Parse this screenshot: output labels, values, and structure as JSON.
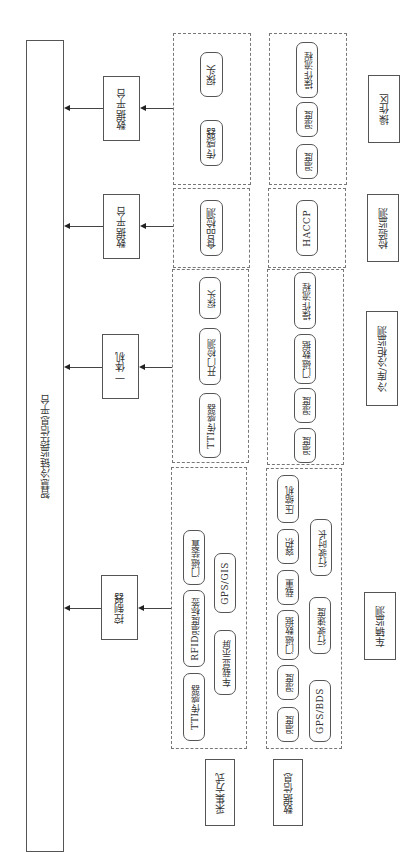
{
  "platform": {
    "label": "智慧冷链监控信息平台"
  },
  "devices": [
    {
      "id": "op",
      "label": "数据平台"
    },
    {
      "id": "insp",
      "label": "数据平台"
    },
    {
      "id": "cold",
      "label": "一体机"
    },
    {
      "id": "veh",
      "label": "控制器"
    }
  ],
  "collection": {
    "op": [
      "传感器",
      "探头"
    ],
    "insp": [
      "食品检测"
    ],
    "cold": [
      "TTI传感器",
      "开门检测",
      "探头"
    ],
    "veh": [
      "TTI传感器",
      "RFID温度标签",
      "门磁装置",
      "车载显示屏",
      "GPS/GIS"
    ]
  },
  "data_info": {
    "op": [
      "温度",
      "湿度",
      "操作流程"
    ],
    "insp": [
      "HACCP"
    ],
    "cold": [
      "温度",
      "湿度",
      "门磁数据",
      "操作流程"
    ],
    "veh": [
      "温度",
      "湿度",
      "门磁数据",
      "载重",
      "容积",
      "压缩机",
      "GPS/BDS",
      "行驶速度",
      "行驶时长"
    ]
  },
  "categories": [
    {
      "id": "op",
      "label": "操作区"
    },
    {
      "id": "insp",
      "label": "检验监测"
    },
    {
      "id": "cold",
      "label": "冷库/冷柜监测"
    },
    {
      "id": "veh",
      "label": "车辆监测"
    }
  ],
  "row_labels": {
    "collection": "采集方式",
    "data_info": "数据信息"
  }
}
